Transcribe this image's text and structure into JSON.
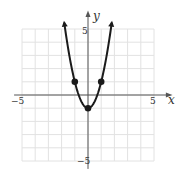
{
  "chart_data": {
    "type": "line",
    "title": "",
    "equation": "y = 2x^2 - 1",
    "xlabel": "x",
    "ylabel": "y",
    "xlim": [
      -5,
      5
    ],
    "ylim": [
      -5,
      5
    ],
    "grid": true,
    "x_tick_labels": [
      "-5",
      "5"
    ],
    "y_tick_labels": [
      "5",
      "-5"
    ],
    "points": [
      {
        "x": -1,
        "y": 1
      },
      {
        "x": 0,
        "y": -1
      },
      {
        "x": 1,
        "y": 1
      }
    ],
    "curve_x_range": [
      -1.8,
      1.8
    ],
    "arrows_on_ends": true
  },
  "labels": {
    "x_axis": "x",
    "y_axis": "y",
    "x_min": "−5",
    "x_max": "5",
    "y_max": "5",
    "y_min": "−5"
  },
  "colors": {
    "grid": "#e2e2e2",
    "axis": "#555555",
    "curve": "#1a1a1a",
    "text": "#333333"
  }
}
